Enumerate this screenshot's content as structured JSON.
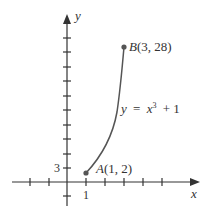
{
  "figure": {
    "axes": {
      "x_label": "x",
      "y_label": "y",
      "x_tick_label": "1",
      "y_tick_label": "3"
    },
    "curve": {
      "equation_lhs": "y",
      "equation_eq": "=",
      "equation_base": "x",
      "equation_exp": "3",
      "equation_rest": "+ 1"
    },
    "points": [
      {
        "name": "A",
        "coords": "(1, 2)"
      },
      {
        "name": "B",
        "coords": "(3, 28)"
      }
    ],
    "colors": {
      "axis": "#333333",
      "curve": "#555555",
      "point": "#555555"
    }
  }
}
